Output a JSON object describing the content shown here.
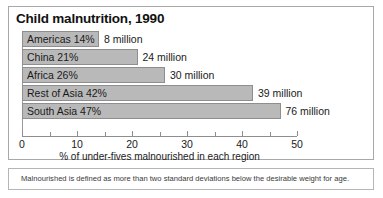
{
  "chart_data": {
    "type": "bar",
    "orientation": "horizontal",
    "title": "Child malnutrition, 1990",
    "xlabel": "% of under-fives malnourished in each region",
    "ylabel": "",
    "xlim": [
      0,
      50
    ],
    "grid": false,
    "legend": null,
    "major_ticks": [
      0,
      10,
      20,
      30,
      40,
      50
    ],
    "minor_ticks": [
      5,
      15,
      25,
      35,
      45
    ],
    "tick_labels": [
      "0",
      "10",
      "20",
      "30",
      "40",
      "50"
    ],
    "categories": [
      "Americas",
      "China",
      "Africa",
      "Rest of Asia",
      "South Asia"
    ],
    "values": [
      14,
      26,
      26,
      42,
      47
    ],
    "series": [
      {
        "name": "% of under-fives malnourished",
        "values": [
          14,
          21,
          26,
          42,
          47
        ]
      }
    ],
    "bars": [
      {
        "label": "Americas 14%",
        "region": "Americas",
        "percent": 14,
        "value_text": "8 million",
        "millions": 8
      },
      {
        "label": "China 21%",
        "region": "China",
        "percent": 21,
        "value_text": "24 million",
        "millions": 24
      },
      {
        "label": "Africa 26%",
        "region": "Africa",
        "percent": 26,
        "value_text": "30 million",
        "millions": 30
      },
      {
        "label": "Rest of Asia 42%",
        "region": "Rest of Asia",
        "percent": 42,
        "value_text": "39 million",
        "millions": 39
      },
      {
        "label": "South Asia 47%",
        "region": "South Asia",
        "percent": 47,
        "value_text": "76 million",
        "millions": 76
      }
    ],
    "annotations": [
      "Malnourished is defined as more than two standard deviations below the desirable weight for age."
    ],
    "colors": {
      "bar_fill": "#b9b9b9",
      "bar_border": "#8e8e8e",
      "axis": "#8e8e8e",
      "frame": "#a8a8a8",
      "text": "#1a1a1a",
      "background": "#ffffff"
    }
  },
  "footnote": {
    "text": "Malnourished is defined as more than two standard deviations below the desirable weight for age."
  }
}
